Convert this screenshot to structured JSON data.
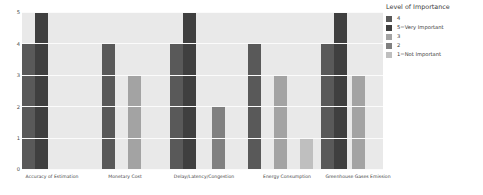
{
  "chart_data": {
    "type": "bar",
    "title": "",
    "xlabel": "",
    "ylabel": "",
    "ylim": [
      0,
      5
    ],
    "yticks": [
      "0",
      "1",
      "2",
      "3",
      "4",
      "5"
    ],
    "grid": true,
    "legend_position": "right",
    "legend_title": "Level of Importance",
    "categories": [
      "Accuracy of Estimation",
      "Monetary Cost",
      "Delay/Latency/Congestion",
      "Energy Consumption",
      "Greenhouse Gases Emission"
    ],
    "series": [
      {
        "name": "4",
        "color": "#595959",
        "values": [
          4,
          4,
          4,
          4,
          4
        ]
      },
      {
        "name": "5=Very Important",
        "color": "#3f3f3f",
        "values": [
          5,
          null,
          5,
          null,
          5
        ]
      },
      {
        "name": "3",
        "color": "#a3a3a3",
        "values": [
          null,
          3,
          null,
          3,
          3
        ]
      },
      {
        "name": "2",
        "color": "#808080",
        "values": [
          null,
          null,
          2,
          null,
          null
        ]
      },
      {
        "name": "1=Not Important",
        "color": "#bfbfbf",
        "values": [
          null,
          null,
          null,
          1,
          null
        ]
      }
    ],
    "bars": [
      {
        "category": "Accuracy of Estimation",
        "series": "4",
        "value": 4,
        "color": "#595959",
        "x": 22,
        "w": 13
      },
      {
        "category": "Accuracy of Estimation",
        "series": "5=Very Important",
        "value": 5,
        "color": "#3f3f3f",
        "x": 35,
        "w": 13
      },
      {
        "category": "Monetary Cost",
        "series": "4",
        "value": 4,
        "color": "#595959",
        "x": 102,
        "w": 13
      },
      {
        "category": "Monetary Cost",
        "series": "3",
        "value": 3,
        "color": "#a3a3a3",
        "x": 128,
        "w": 13
      },
      {
        "category": "Delay/Latency/Congestion",
        "series": "4",
        "value": 4,
        "color": "#595959",
        "x": 170,
        "w": 13
      },
      {
        "category": "Delay/Latency/Congestion",
        "series": "5=Very Important",
        "value": 5,
        "color": "#3f3f3f",
        "x": 183,
        "w": 13
      },
      {
        "category": "Delay/Latency/Congestion",
        "series": "2",
        "value": 2,
        "color": "#808080",
        "x": 212,
        "w": 13
      },
      {
        "category": "Energy Consumption",
        "series": "4",
        "value": 4,
        "color": "#595959",
        "x": 248,
        "w": 13
      },
      {
        "category": "Energy Consumption",
        "series": "3",
        "value": 3,
        "color": "#a3a3a3",
        "x": 274,
        "w": 13
      },
      {
        "category": "Energy Consumption",
        "series": "1=Not Important",
        "value": 1,
        "color": "#bfbfbf",
        "x": 300,
        "w": 13
      },
      {
        "category": "Greenhouse Gases Emission",
        "series": "4",
        "value": 4,
        "color": "#595959",
        "x": 321,
        "w": 13
      },
      {
        "category": "Greenhouse Gases Emission",
        "series": "5=Very Important",
        "value": 5,
        "color": "#3f3f3f",
        "x": 334,
        "w": 13
      },
      {
        "category": "Greenhouse Gases Emission",
        "series": "3",
        "value": 3,
        "color": "#a3a3a3",
        "x": 352,
        "w": 13
      }
    ],
    "category_label_x": [
      52,
      125,
      204,
      287,
      358
    ]
  },
  "legend": {
    "title": "Level of Importance",
    "entries": [
      {
        "label": "4",
        "color": "#595959"
      },
      {
        "label": "5=Very Important",
        "color": "#3f3f3f"
      },
      {
        "label": "3",
        "color": "#a3a3a3"
      },
      {
        "label": "2",
        "color": "#808080"
      },
      {
        "label": "1=Not Important",
        "color": "#bfbfbf"
      }
    ]
  },
  "style": {
    "plot_background": "#e9e9e9",
    "gridline_color": "#fbfbfb",
    "figure_background": "#ffffff",
    "tick_text_color": "#3f3f3f"
  }
}
